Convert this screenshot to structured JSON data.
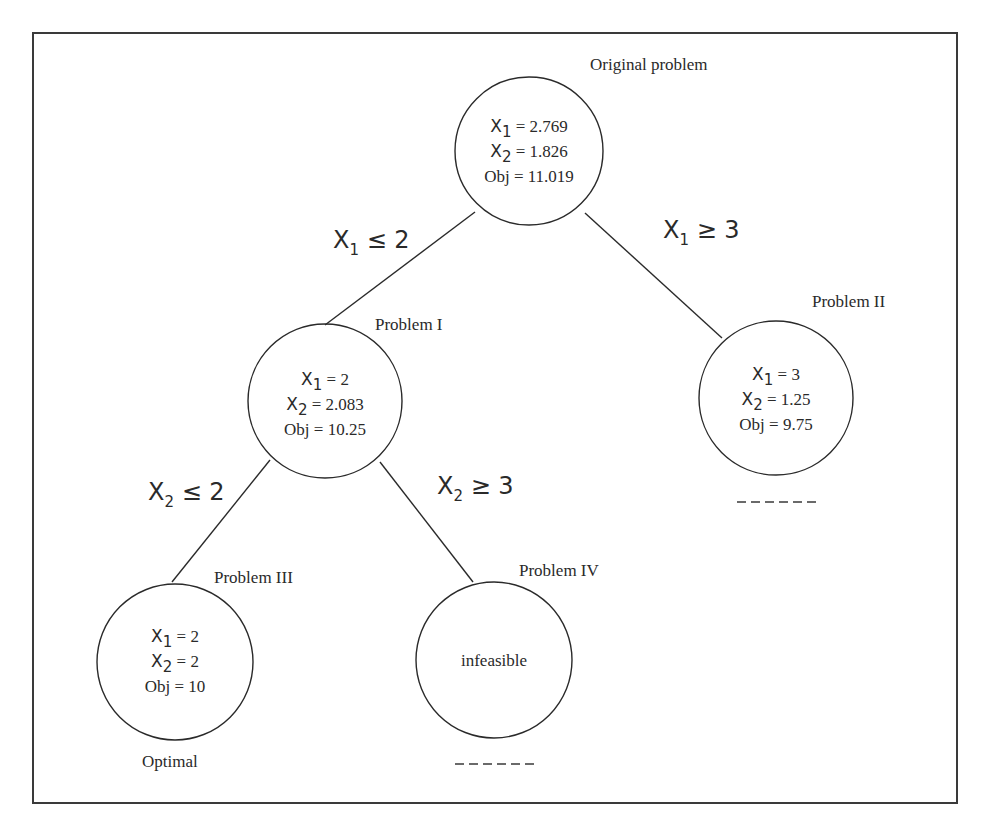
{
  "diagram": {
    "type": "branch-and-bound-tree",
    "nodes": {
      "root": {
        "title": "Original problem",
        "var1": "X",
        "var1_sub": "1",
        "var1_value": " = 2.769",
        "var2": "X",
        "var2_sub": "2",
        "var2_value": " = 1.826",
        "obj": "Obj = 11.019"
      },
      "p1": {
        "title": "Problem I",
        "var1": "X",
        "var1_sub": "1",
        "var1_value": " = 2",
        "var2": "X",
        "var2_sub": "2",
        "var2_value": " = 2.083",
        "obj": "Obj = 10.25"
      },
      "p2": {
        "title": "Problem II",
        "var1": "X",
        "var1_sub": "1",
        "var1_value": " = 3",
        "var2": "X",
        "var2_sub": "2",
        "var2_value": " = 1.25",
        "obj": "Obj = 9.75",
        "status_marker": "------"
      },
      "p3": {
        "title": "Problem III",
        "var1": "X",
        "var1_sub": "1",
        "var1_value": " = 2",
        "var2": "X",
        "var2_sub": "2",
        "var2_value": " = 2",
        "obj": "Obj = 10",
        "status": "Optimal"
      },
      "p4": {
        "title": "Problem IV",
        "content": "infeasible",
        "status_marker": "------"
      }
    },
    "branches": {
      "root_p1": {
        "var": "X",
        "sub": "1",
        "rel": " ≤ 2"
      },
      "root_p2": {
        "var": "X",
        "sub": "1",
        "rel": " ≥ 3"
      },
      "p1_p3": {
        "var": "X",
        "sub": "2",
        "rel": " ≤ 2"
      },
      "p1_p4": {
        "var": "X",
        "sub": "2",
        "rel": " ≥ 3"
      }
    }
  }
}
